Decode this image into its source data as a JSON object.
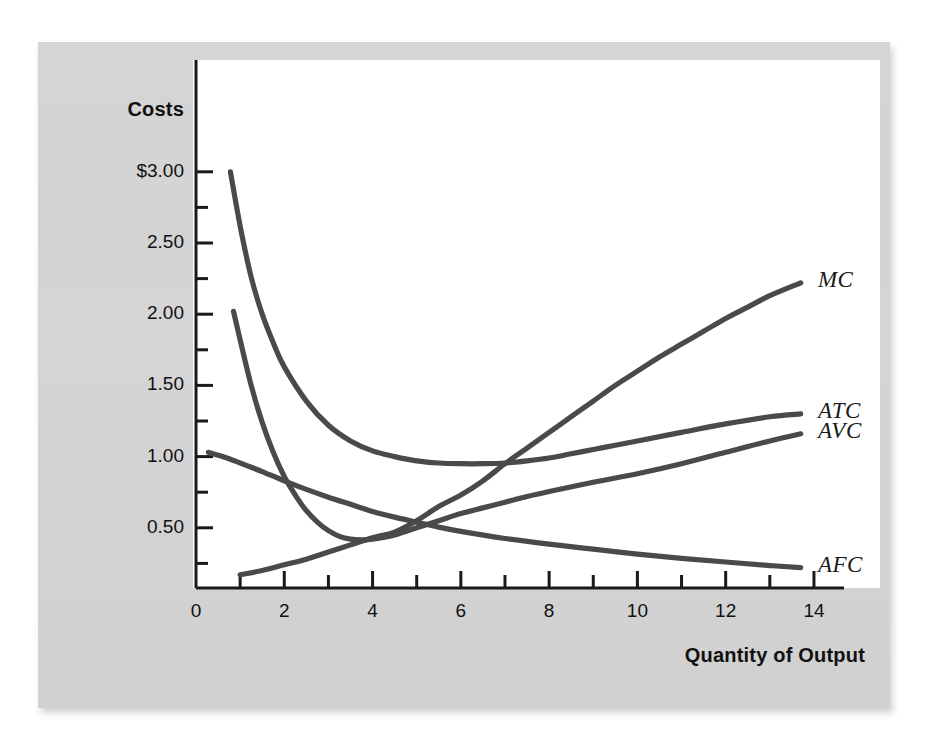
{
  "figure": {
    "y_axis_title": "Costs",
    "x_axis_title": "Quantity of Output",
    "background_color": "#d3d3d3",
    "plot_background_color": "#ffffff",
    "curve_color": "#4a4a4a",
    "axis_color": "#1a1a1a"
  },
  "chart_data": {
    "type": "line",
    "title": "",
    "subtitle": "",
    "xlabel": "Quantity of Output",
    "ylabel": "Costs",
    "xlim": [
      0,
      14.6
    ],
    "ylim": [
      0.08,
      3.3
    ],
    "grid": false,
    "legend_position": "right-of-curve-ends",
    "x_ticks_major": [
      0,
      2,
      4,
      6,
      8,
      10,
      12,
      14
    ],
    "x_tick_labels": [
      "0",
      "2",
      "4",
      "6",
      "8",
      "10",
      "12",
      "14"
    ],
    "x_ticks_minor": [
      1,
      3,
      5,
      7,
      9,
      11,
      13
    ],
    "y_ticks_major": [
      3.0,
      2.5,
      2.0,
      1.5,
      1.0,
      0.5
    ],
    "y_tick_labels": [
      "$3.00",
      "2.50",
      "2.00",
      "1.50",
      "1.00",
      "0.50"
    ],
    "y_ticks_minor": [
      2.75,
      2.25,
      1.75,
      1.25,
      0.75,
      0.25
    ],
    "annotations": [
      {
        "text": "MC",
        "x": 14.0,
        "y": 2.22
      },
      {
        "text": "ATC",
        "x": 14.0,
        "y": 1.3
      },
      {
        "text": "AVC",
        "x": 14.0,
        "y": 1.16
      },
      {
        "text": "AFC",
        "x": 14.0,
        "y": 0.22
      }
    ],
    "series": [
      {
        "name": "MC",
        "label": "MC",
        "color": "#4a4a4a",
        "x": [
          1.0,
          1.5,
          2.0,
          2.5,
          3.0,
          3.5,
          4.0,
          4.5,
          5.0,
          5.5,
          6.0,
          6.5,
          7.0,
          7.5,
          8.0,
          8.5,
          9.0,
          9.5,
          10.0,
          10.5,
          11.0,
          11.5,
          12.0,
          12.5,
          13.0,
          13.7
        ],
        "y": [
          0.17,
          0.2,
          0.24,
          0.28,
          0.33,
          0.38,
          0.43,
          0.47,
          0.55,
          0.65,
          0.73,
          0.83,
          0.95,
          1.06,
          1.17,
          1.28,
          1.39,
          1.5,
          1.6,
          1.7,
          1.79,
          1.88,
          1.97,
          2.05,
          2.13,
          2.22
        ]
      },
      {
        "name": "ATC",
        "label": "ATC",
        "color": "#4a4a4a",
        "x": [
          0.78,
          1.0,
          1.25,
          1.5,
          1.75,
          2.0,
          2.5,
          3.0,
          3.5,
          4.0,
          4.5,
          5.0,
          5.5,
          6.0,
          6.5,
          7.0,
          7.5,
          8.0,
          8.5,
          9.0,
          9.5,
          10.0,
          11.0,
          12.0,
          13.0,
          13.7
        ],
        "y": [
          3.0,
          2.62,
          2.26,
          2.0,
          1.8,
          1.63,
          1.39,
          1.22,
          1.11,
          1.04,
          1.0,
          0.97,
          0.955,
          0.95,
          0.95,
          0.955,
          0.97,
          0.99,
          1.02,
          1.05,
          1.08,
          1.11,
          1.17,
          1.23,
          1.28,
          1.3
        ]
      },
      {
        "name": "AVC",
        "label": "AVC",
        "color": "#4a4a4a",
        "x": [
          0.85,
          1.0,
          1.25,
          1.5,
          1.75,
          2.0,
          2.25,
          2.5,
          2.75,
          3.0,
          3.25,
          3.5,
          3.75,
          4.0,
          4.5,
          5.0,
          5.5,
          6.0,
          6.5,
          7.0,
          7.5,
          8.0,
          9.0,
          10.0,
          11.0,
          12.0,
          13.0,
          13.7
        ],
        "y": [
          2.02,
          1.82,
          1.5,
          1.24,
          1.03,
          0.86,
          0.73,
          0.62,
          0.54,
          0.48,
          0.44,
          0.42,
          0.415,
          0.42,
          0.45,
          0.5,
          0.55,
          0.6,
          0.64,
          0.68,
          0.72,
          0.755,
          0.82,
          0.88,
          0.95,
          1.03,
          1.11,
          1.16
        ]
      },
      {
        "name": "AFC",
        "label": "AFC",
        "color": "#4a4a4a",
        "x": [
          0.28,
          0.5,
          0.75,
          1.0,
          1.25,
          1.5,
          2.0,
          2.5,
          3.0,
          3.5,
          4.0,
          4.5,
          5.0,
          5.5,
          6.0,
          7.0,
          8.0,
          9.0,
          10.0,
          11.0,
          12.0,
          13.0,
          13.7
        ],
        "y": [
          1.03,
          1.01,
          0.985,
          0.955,
          0.925,
          0.895,
          0.83,
          0.77,
          0.715,
          0.665,
          0.615,
          0.575,
          0.54,
          0.505,
          0.475,
          0.425,
          0.385,
          0.35,
          0.315,
          0.285,
          0.26,
          0.235,
          0.22
        ]
      }
    ]
  }
}
